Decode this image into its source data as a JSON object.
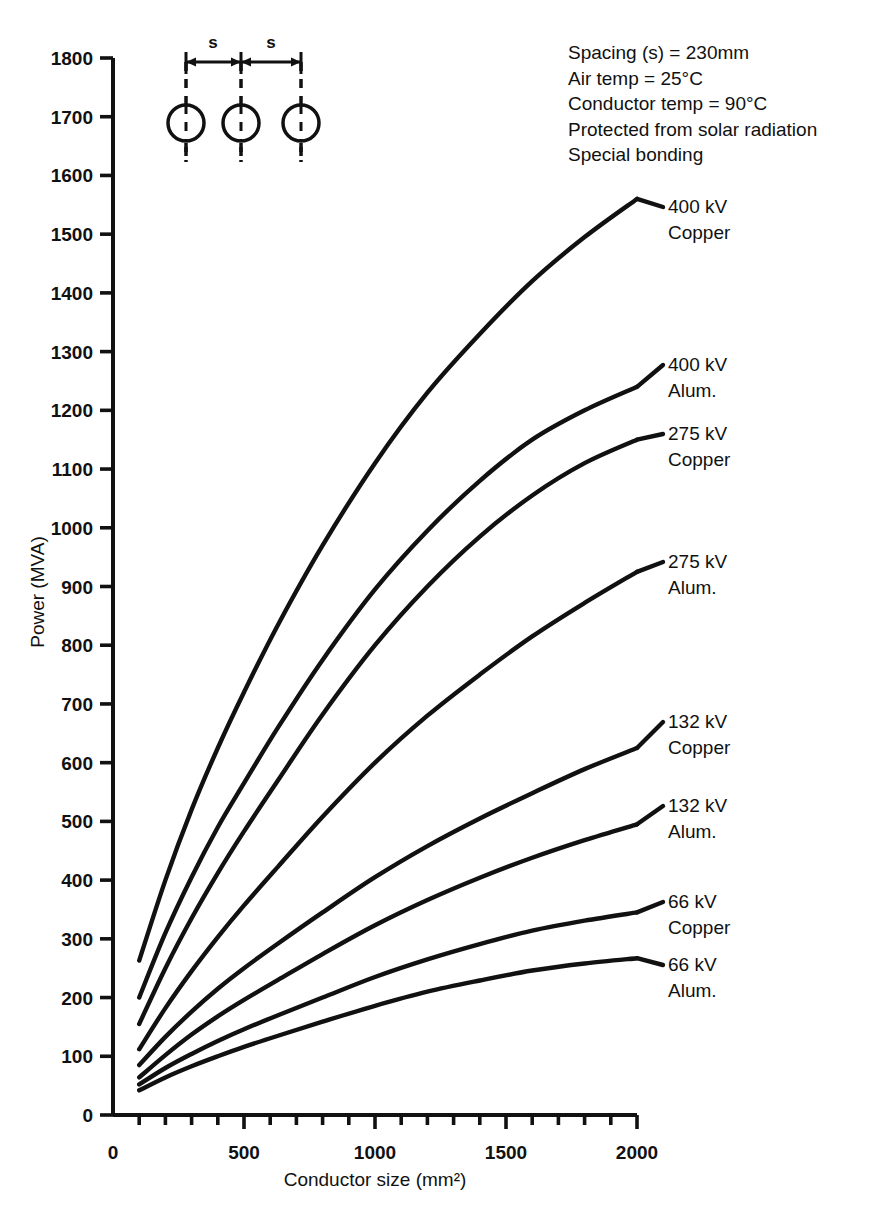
{
  "chart_data": {
    "type": "line",
    "title": "",
    "xlabel": "Conductor size (mm²)",
    "ylabel": "Power (MVA)",
    "xlim": [
      0,
      2000
    ],
    "ylim": [
      0,
      1800
    ],
    "x_ticks_major": [
      0,
      500,
      1000,
      1500,
      2000
    ],
    "x_tick_labels": [
      "0",
      "500",
      "1000",
      "1500",
      "2000"
    ],
    "x_minor_step": 100,
    "y_ticks": [
      0,
      100,
      200,
      300,
      400,
      500,
      600,
      700,
      800,
      900,
      1000,
      1100,
      1200,
      1300,
      1400,
      1500,
      1600,
      1700,
      1800
    ],
    "y_tick_labels": [
      "0",
      "100",
      "200",
      "300",
      "400",
      "500",
      "600",
      "700",
      "800",
      "900",
      "1000",
      "1100",
      "1200",
      "1300",
      "1400",
      "1500",
      "1600",
      "1700",
      "1800"
    ],
    "grid": false,
    "legend": "inline-right-labels",
    "x": [
      100,
      200,
      300,
      400,
      500,
      630,
      800,
      1000,
      1200,
      1400,
      1600,
      1800,
      2000
    ],
    "series": [
      {
        "name": "400 kV Copper",
        "label_line1": "400 kV",
        "label_line2": "Copper",
        "values": [
          263,
          400,
          520,
          625,
          720,
          835,
          970,
          1110,
          1230,
          1330,
          1420,
          1495,
          1560
        ]
      },
      {
        "name": "400 kV Alum.",
        "label_line1": "400 kV",
        "label_line2": "Alum.",
        "values": [
          200,
          310,
          405,
          490,
          565,
          660,
          775,
          895,
          995,
          1080,
          1150,
          1200,
          1240
        ]
      },
      {
        "name": "275 kV Copper",
        "label_line1": "275 kV",
        "label_line2": "Copper",
        "values": [
          155,
          250,
          335,
          412,
          483,
          570,
          682,
          800,
          900,
          985,
          1055,
          1110,
          1150
        ]
      },
      {
        "name": "275 kV Alum.",
        "label_line1": "275 kV",
        "label_line2": "Alum.",
        "values": [
          112,
          182,
          245,
          303,
          357,
          423,
          508,
          600,
          680,
          750,
          815,
          872,
          925
        ]
      },
      {
        "name": "132 kV Copper",
        "label_line1": "132 kV",
        "label_line2": "Copper",
        "values": [
          85,
          133,
          176,
          215,
          250,
          292,
          345,
          405,
          458,
          505,
          548,
          589,
          625
        ]
      },
      {
        "name": "132 kV Alum.",
        "label_line1": "132 kV",
        "label_line2": "Alum.",
        "values": [
          64,
          102,
          137,
          168,
          196,
          230,
          274,
          323,
          366,
          404,
          438,
          468,
          495
        ]
      },
      {
        "name": "66 kV Copper",
        "label_line1": "66 kV",
        "label_line2": "Copper",
        "values": [
          52,
          80,
          104,
          126,
          146,
          170,
          200,
          235,
          265,
          291,
          314,
          331,
          345
        ]
      },
      {
        "name": "66 kV Alum.",
        "label_line1": "66 kV",
        "label_line2": "Alum.",
        "values": [
          42,
          64,
          83,
          100,
          116,
          135,
          159,
          186,
          210,
          229,
          246,
          258,
          267
        ]
      }
    ]
  },
  "notes": {
    "lines": [
      "Spacing (s)  =  230mm",
      "Air temp  =  25°C",
      "Conductor temp  =  90°C",
      "Protected from solar radiation",
      "Special bonding"
    ]
  },
  "inset": {
    "spacing_label_left": "s",
    "spacing_label_right": "s",
    "conductor_count": 3
  }
}
